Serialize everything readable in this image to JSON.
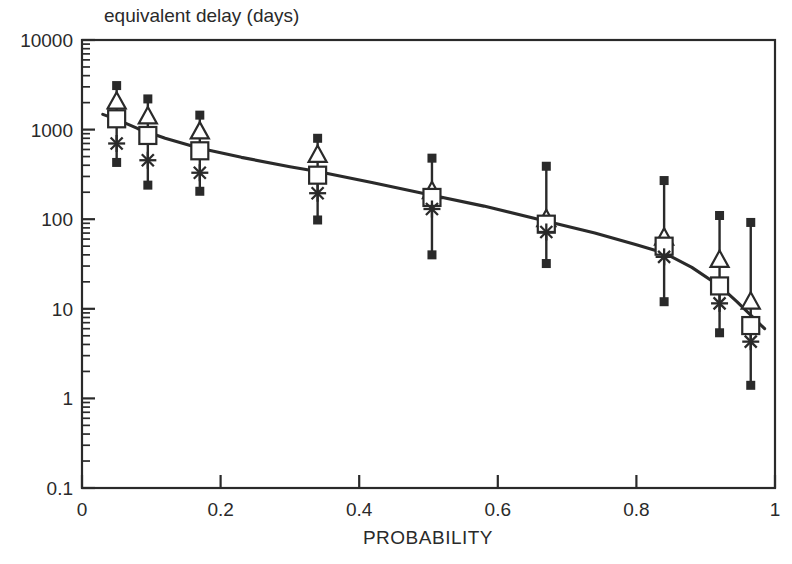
{
  "chart_data": {
    "type": "scatter",
    "title": "equivalent delay (days)",
    "xlabel": "PROBABILITY",
    "ylabel": "equivalent delay (days)",
    "yscale": "log",
    "xscale": "linear",
    "xlim": [
      0,
      1
    ],
    "ylim": [
      0.1,
      10000
    ],
    "grid": false,
    "legend": null,
    "xticks": [
      "0",
      "0.2",
      "0.4",
      "0.6",
      "0.8",
      "1"
    ],
    "xtick_values": [
      0,
      0.2,
      0.4,
      0.6,
      0.8,
      1
    ],
    "yticks": [
      "10000",
      "1000",
      "100",
      "10",
      "1",
      "0.1"
    ],
    "ytick_values": [
      10000,
      1000,
      100,
      10,
      1,
      0.1
    ],
    "x": [
      0.05,
      0.095,
      0.17,
      0.34,
      0.505,
      0.67,
      0.84,
      0.92,
      0.965
    ],
    "series": [
      {
        "name": "upper-error-cap",
        "marker": "filled-square",
        "values": [
          3100,
          2200,
          1450,
          800,
          480,
          390,
          270,
          110,
          92
        ]
      },
      {
        "name": "triangle",
        "marker": "open-triangle",
        "values": [
          2050,
          1400,
          950,
          520,
          205,
          100,
          62,
          35,
          12
        ]
      },
      {
        "name": "square",
        "marker": "open-square",
        "values": [
          1320,
          860,
          580,
          310,
          175,
          88,
          50,
          18,
          6.5
        ]
      },
      {
        "name": "asterisk",
        "marker": "asterisk",
        "values": [
          700,
          455,
          330,
          195,
          130,
          72,
          38,
          11.5,
          4.3
        ]
      },
      {
        "name": "lower-error-cap",
        "marker": "filled-square",
        "values": [
          430,
          240,
          205,
          98,
          40,
          32,
          12,
          5.4,
          1.4
        ]
      },
      {
        "name": "fit-curve",
        "marker": "line",
        "x": [
          0.03,
          0.05,
          0.08,
          0.12,
          0.17,
          0.23,
          0.3,
          0.34,
          0.42,
          0.505,
          0.58,
          0.67,
          0.74,
          0.8,
          0.84,
          0.88,
          0.92,
          0.945,
          0.965,
          0.985
        ],
        "values": [
          1480,
          1300,
          1030,
          800,
          620,
          490,
          385,
          340,
          255,
          185,
          140,
          95,
          70,
          52,
          42,
          29,
          18,
          12,
          8.5,
          6.0
        ]
      }
    ],
    "annotations": []
  }
}
